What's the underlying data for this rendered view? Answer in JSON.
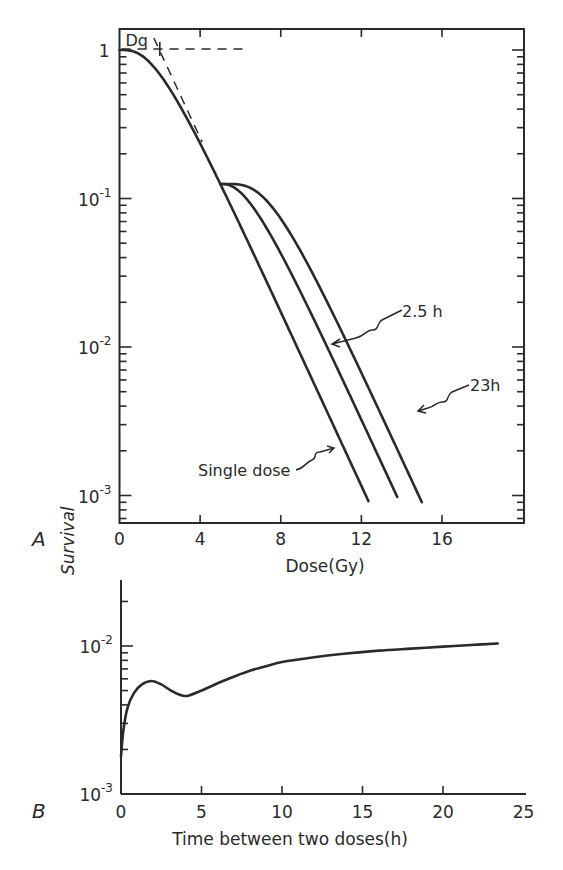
{
  "chart_data": [
    {
      "id": "A",
      "type": "line",
      "panel_label": "A",
      "title": "",
      "xlabel": "Dose(Gy)",
      "ylabel": "Survival",
      "xscale": "linear",
      "yscale": "log",
      "xlim": [
        0,
        20
      ],
      "ylim": [
        0.0006,
        1.15
      ],
      "xticks": [
        0,
        4,
        8,
        12,
        16
      ],
      "xtick_labels": [
        "0",
        "4",
        "8",
        "12",
        "16"
      ],
      "yticks": [
        1,
        0.1,
        0.01,
        0.001
      ],
      "ytick_labels": [
        {
          "base": "1",
          "exp": ""
        },
        {
          "base": "10",
          "exp": "-1"
        },
        {
          "base": "10",
          "exp": "-2"
        },
        {
          "base": "10",
          "exp": "-3"
        }
      ],
      "grid": false,
      "model": {
        "D0": 1.48,
        "n": 3.86,
        "split_dose": 5.0
      },
      "series": [
        {
          "name": "Single dose",
          "label": "Single dose",
          "points": [
            [
              0,
              1.0
            ],
            [
              1,
              0.82
            ],
            [
              2,
              0.55
            ],
            [
              3,
              0.33
            ],
            [
              4,
              0.19
            ],
            [
              5,
              0.13
            ],
            [
              6,
              0.066
            ],
            [
              8,
              0.017
            ],
            [
              10,
              0.0044
            ],
            [
              12,
              0.0011
            ],
            [
              12.35,
              0.00077
            ]
          ],
          "second_dose_shoulder_gy": 0,
          "x_end": 12.35
        },
        {
          "name": "2.5 h",
          "label": "2.5 h",
          "points": [
            [
              5,
              0.13
            ],
            [
              6,
              0.11
            ],
            [
              7,
              0.068
            ],
            [
              8,
              0.036
            ],
            [
              10,
              0.0094
            ],
            [
              12,
              0.0024
            ],
            [
              13.78,
              0.00087
            ]
          ],
          "second_dose_shoulder_gy": 1.6,
          "x_end": 13.78
        },
        {
          "name": "23 h",
          "label": "23h",
          "points": [
            [
              5,
              0.13
            ],
            [
              6,
              0.123
            ],
            [
              7,
              0.1
            ],
            [
              8,
              0.068
            ],
            [
              10,
              0.024
            ],
            [
              12,
              0.0066
            ],
            [
              14,
              0.0017
            ],
            [
              15,
              0.00098
            ]
          ],
          "second_dose_shoulder_gy": 2.7,
          "x_end": 15.0
        }
      ],
      "annotations": [
        {
          "text": "Dq",
          "x": 2,
          "note": "quasi-threshold dose, extrapolation intercept"
        },
        {
          "text": "Single dose",
          "points_to": "Single dose"
        },
        {
          "text": "2.5 h",
          "points_to": "2.5 h"
        },
        {
          "text": "23h",
          "points_to": "23 h"
        }
      ],
      "extrapolation_line": {
        "from": [
          2,
          1.0
        ],
        "to": [
          4.1,
          0.24
        ]
      },
      "reference_line": {
        "y": 1.0,
        "x_from": 0,
        "x_to": 6.1
      }
    },
    {
      "id": "B",
      "type": "line",
      "panel_label": "B",
      "title": "",
      "xlabel": "Time between two doses(h)",
      "ylabel": "Survival",
      "xscale": "linear",
      "yscale": "log",
      "xlim": [
        0,
        25
      ],
      "ylim": [
        0.001,
        0.028
      ],
      "xticks": [
        0,
        5,
        10,
        15,
        20,
        25
      ],
      "xtick_labels": [
        "0",
        "5",
        "10",
        "15",
        "20",
        "25"
      ],
      "yticks": [
        0.01,
        0.001
      ],
      "ytick_labels": [
        {
          "base": "10",
          "exp": "-2"
        },
        {
          "base": "10",
          "exp": "-3"
        }
      ],
      "grid": false,
      "series": [
        {
          "name": "Survival vs interval",
          "x": [
            0,
            0.15,
            0.4,
            0.8,
            1.3,
            1.9,
            2.5,
            3.1,
            3.6,
            4.1,
            5,
            6,
            7,
            8,
            9,
            10,
            12,
            14,
            16,
            18,
            20,
            22,
            23.4
          ],
          "y": [
            0.0018,
            0.0027,
            0.0038,
            0.0048,
            0.0055,
            0.0058,
            0.0055,
            0.005,
            0.0047,
            0.0046,
            0.005,
            0.0056,
            0.0062,
            0.0068,
            0.0073,
            0.0078,
            0.0084,
            0.0089,
            0.0093,
            0.0096,
            0.0099,
            0.0102,
            0.0104
          ]
        }
      ]
    }
  ]
}
